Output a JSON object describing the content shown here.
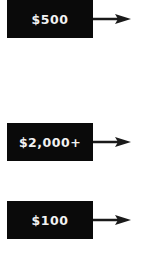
{
  "items": [
    {
      "label": "$500",
      "icon": "arrow-right-icon"
    },
    {
      "label": "$2,000+",
      "icon": "arrow-right-icon"
    },
    {
      "label": "$100",
      "icon": "arrow-right-icon"
    }
  ],
  "colors": {
    "box": "#0a0a0a",
    "text": "#f2f2f2",
    "arrow": "#1a1a1a"
  }
}
